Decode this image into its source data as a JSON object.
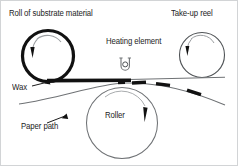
{
  "diagram": {
    "type": "schematic",
    "background_color": "#ffffff",
    "border_color": "#d2d4d6",
    "ink_color": "#1c1c1c",
    "line_color": "#8a8d90",
    "labels": {
      "roll": "Roll of substrate material",
      "takeup": "Take-up reel",
      "heating": "Heating element",
      "wax": "Wax",
      "paper_path": "Paper path",
      "roller": "Roller"
    },
    "icons": {
      "supply_roll": "supply-roll-icon",
      "takeup_reel": "takeup-reel-icon",
      "roller": "roller-icon",
      "heating_element": "heating-element-icon",
      "rotation_arrow": "rotation-arrow-icon",
      "wax_pointer": "wax-pointer-arrow-icon",
      "paper_pointer": "paper-path-pointer-arrow-icon"
    },
    "components": [
      {
        "name": "supply-roll",
        "cx": 47,
        "cy": 55,
        "r": 26,
        "stroke_width": 3,
        "rotation": "clockwise"
      },
      {
        "name": "takeup-reel",
        "cx": 201,
        "cy": 54,
        "r": 23,
        "stroke_width": 1,
        "rotation": "clockwise"
      },
      {
        "name": "roller",
        "cx": 121,
        "cy": 122,
        "r": 36,
        "stroke_width": 1,
        "rotation": "clockwise"
      },
      {
        "name": "heating-element",
        "cx": 124,
        "cy": 63,
        "width": 9,
        "height": 11
      }
    ],
    "web": {
      "coated_segment": {
        "from_x": 47,
        "to_x": 130,
        "y": 79,
        "thickness": 3.4,
        "color": "#111111"
      },
      "bare_segment": {
        "from_x": 130,
        "to_x": 224,
        "y": 79,
        "thickness": 1,
        "color": "#6f7275"
      },
      "residual_wax_patches": 4
    }
  }
}
